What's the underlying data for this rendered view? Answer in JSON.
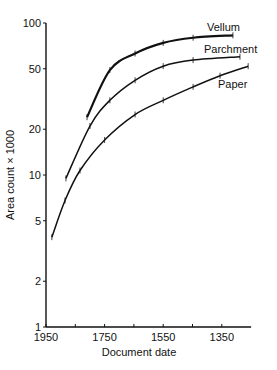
{
  "chart_data": {
    "type": "line",
    "title": "",
    "xlabel": "Document date",
    "ylabel": "Area count × 1000",
    "yscale": "log",
    "ylim": [
      1,
      100
    ],
    "xlim": [
      1950,
      1250
    ],
    "x_reversed": true,
    "grid": false,
    "legend": "inline labels at curve ends",
    "x_ticks": [
      1950,
      1850,
      1750,
      1650,
      1550,
      1450,
      1350
    ],
    "x_tick_labels": [
      "1950",
      "1750",
      "1550",
      "1350"
    ],
    "y_ticks": [
      1,
      2,
      5,
      10,
      20,
      50,
      100
    ],
    "y_tick_labels": [
      "1",
      "2",
      "5",
      "10",
      "20",
      "50",
      "100"
    ],
    "series": [
      {
        "name": "Vellum",
        "x": [
          1810,
          1732,
          1646,
          1550,
          1448,
          1312
        ],
        "y": [
          24,
          49,
          63,
          74,
          80,
          83
        ]
      },
      {
        "name": "Parchment",
        "x": [
          1882,
          1800,
          1732,
          1646,
          1550,
          1448,
          1288
        ],
        "y": [
          9.5,
          21,
          31,
          42,
          52,
          57,
          60
        ]
      },
      {
        "name": "Paper",
        "x": [
          1930,
          1885,
          1834,
          1750,
          1646,
          1550,
          1448,
          1356,
          1260
        ],
        "y": [
          3.9,
          6.8,
          10.7,
          17,
          25,
          31,
          38,
          45,
          52
        ]
      }
    ]
  }
}
